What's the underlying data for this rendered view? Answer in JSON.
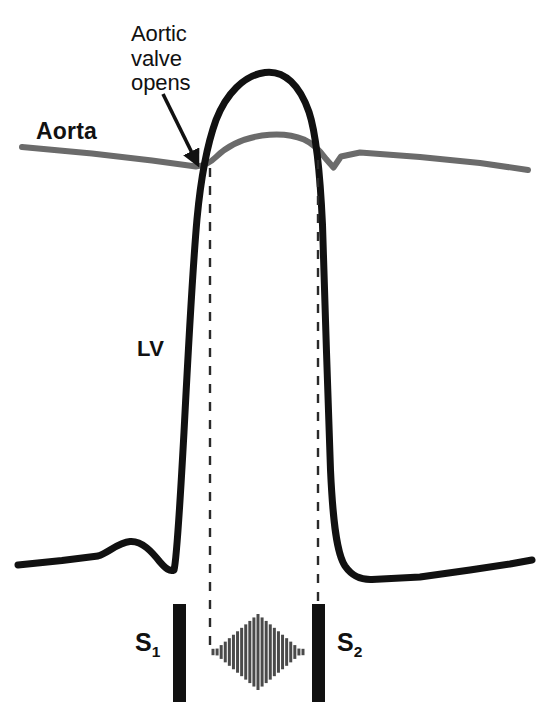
{
  "figure": {
    "width": 544,
    "height": 720,
    "background": "#ffffff"
  },
  "labels": {
    "aortic_valve_opens": "Aortic\nvalve\nopens",
    "aorta": "Aorta",
    "lv": "LV",
    "s1_letter": "S",
    "s1_sub": "1",
    "s2_letter": "S",
    "s2_sub": "2"
  },
  "colors": {
    "lv_curve": "#111111",
    "aorta_curve": "#6b6b6b",
    "sound_bar": "#111111",
    "murmur": "#4a4a4a",
    "dashed_line": "#2a2a2a",
    "arrow": "#111111",
    "text": "#111111",
    "background": "#ffffff"
  },
  "chart_data": {
    "type": "line",
    "xlabel": "",
    "ylabel": "",
    "grid": false,
    "legend": "inline-annotations",
    "note": "Pixel coordinates in a 544x720 canvas; y increases downward so higher pressure = smaller y",
    "series": [
      {
        "name": "Aorta",
        "color": "#6b6b6b",
        "stroke_width": 6,
        "points": [
          [
            22,
            147
          ],
          [
            90,
            153
          ],
          [
            150,
            160
          ],
          [
            196,
            166
          ],
          [
            214,
            160
          ],
          [
            232,
            150
          ],
          [
            252,
            141
          ],
          [
            272,
            135
          ],
          [
            292,
            134
          ],
          [
            310,
            138
          ],
          [
            324,
            147
          ],
          [
            332,
            157
          ],
          [
            340,
            165
          ],
          [
            348,
            155
          ],
          [
            360,
            152
          ],
          [
            420,
            157
          ],
          [
            480,
            163
          ],
          [
            528,
            170
          ]
        ],
        "features": [
          {
            "name": "aortic-valve-opening-point",
            "x": 200,
            "y": 166
          },
          {
            "name": "systolic-peak",
            "x": 282,
            "y": 134
          },
          {
            "name": "dicrotic-notch",
            "x": 340,
            "y": 165
          }
        ]
      },
      {
        "name": "LV",
        "color": "#111111",
        "stroke_width": 7,
        "points": [
          [
            18,
            565
          ],
          [
            60,
            560
          ],
          [
            96,
            556
          ],
          [
            112,
            549
          ],
          [
            128,
            542
          ],
          [
            140,
            543
          ],
          [
            150,
            551
          ],
          [
            160,
            562
          ],
          [
            170,
            570
          ],
          [
            178,
            540
          ],
          [
            186,
            440
          ],
          [
            192,
            330
          ],
          [
            196,
            245
          ],
          [
            200,
            190
          ],
          [
            206,
            150
          ],
          [
            216,
            118
          ],
          [
            230,
            95
          ],
          [
            246,
            80
          ],
          [
            264,
            73
          ],
          [
            282,
            76
          ],
          [
            296,
            88
          ],
          [
            308,
            110
          ],
          [
            316,
            145
          ],
          [
            322,
            210
          ],
          [
            326,
            320
          ],
          [
            330,
            440
          ],
          [
            336,
            520
          ],
          [
            344,
            560
          ],
          [
            352,
            575
          ],
          [
            366,
            580
          ],
          [
            400,
            578
          ],
          [
            450,
            572
          ],
          [
            500,
            565
          ],
          [
            530,
            560
          ]
        ],
        "features": [
          {
            "name": "a-wave-atrial-contraction",
            "x": 134,
            "y": 542
          },
          {
            "name": "isovolumic-contraction-start",
            "x": 176,
            "y": 560
          },
          {
            "name": "aortic-valve-opens",
            "x": 200,
            "y": 190
          },
          {
            "name": "lv-systolic-peak",
            "x": 265,
            "y": 72
          },
          {
            "name": "aortic-valve-closes",
            "x": 320,
            "y": 190
          },
          {
            "name": "diastolic-baseline",
            "x": 400,
            "y": 578
          }
        ]
      }
    ],
    "dashed_markers": [
      {
        "name": "aortic-valve-opening-marker",
        "x": 210,
        "y_top": 168,
        "y_bottom": 648
      },
      {
        "name": "aortic-valve-closing-marker",
        "x": 318,
        "y_top": 160,
        "y_bottom": 604
      }
    ],
    "heart_sounds": [
      {
        "name": "S1",
        "x": 173,
        "y_top": 604,
        "width": 13,
        "height": 98
      },
      {
        "name": "S2",
        "x": 312,
        "y_top": 604,
        "width": 13,
        "height": 98
      }
    ],
    "murmur": {
      "name": "systolic-ejection-murmur",
      "shape": "diamond",
      "pattern": "crescendo-decrescendo",
      "x_start": 213,
      "x_end": 303,
      "center_x": 258,
      "center_y": 652,
      "max_half_height": 38,
      "line_count": 23
    },
    "arrow": {
      "name": "aortic-valve-opens-arrow",
      "from": [
        163,
        94
      ],
      "to": [
        199,
        167
      ]
    }
  }
}
